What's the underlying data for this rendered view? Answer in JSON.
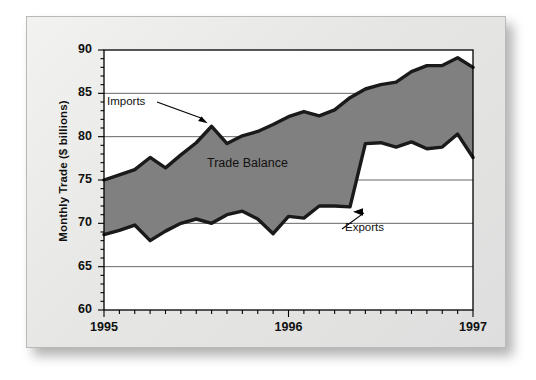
{
  "chart_data": {
    "type": "area",
    "title": "",
    "xlabel": "",
    "ylabel": "Monthly Trade ($ billions)",
    "ylim": [
      60,
      90
    ],
    "yticks": [
      60,
      65,
      70,
      75,
      80,
      85,
      90
    ],
    "ytick_labels": [
      "60",
      "65",
      "70",
      "75",
      "80",
      "85",
      "90"
    ],
    "xlim": [
      0,
      24
    ],
    "xticks": [
      0,
      12,
      24
    ],
    "xtick_labels": [
      "1995",
      "1996",
      "1997"
    ],
    "minor_xticks_per_interval": 12,
    "grid": "horizontal",
    "legend": "none",
    "annotations": [
      {
        "text": "Imports",
        "kind": "arrow-label",
        "points_to_series": "Imports"
      },
      {
        "text": "Exports",
        "kind": "arrow-label",
        "points_to_series": "Exports"
      },
      {
        "text": "Trade Balance",
        "kind": "region-label",
        "region": "between Imports and Exports"
      }
    ],
    "x": [
      0,
      1,
      2,
      3,
      4,
      5,
      6,
      7,
      8,
      9,
      10,
      11,
      12,
      13,
      14,
      15,
      16,
      17,
      18,
      19,
      20,
      21,
      22,
      23,
      24
    ],
    "series": [
      {
        "name": "Imports",
        "fill_to": "Exports",
        "color": "#1a1a1a",
        "values": [
          75.0,
          75.6,
          76.2,
          77.6,
          76.4,
          77.9,
          79.3,
          81.2,
          79.2,
          80.1,
          80.6,
          81.4,
          82.3,
          82.9,
          82.4,
          83.1,
          84.5,
          85.5,
          86.0,
          86.3,
          87.5,
          88.2,
          88.2,
          89.1,
          88.0
        ]
      },
      {
        "name": "Exports",
        "color": "#1a1a1a",
        "values": [
          68.7,
          69.2,
          69.8,
          68.0,
          69.1,
          70.0,
          70.5,
          70.0,
          71.0,
          71.4,
          70.5,
          68.8,
          70.8,
          70.6,
          72.0,
          72.0,
          71.9,
          79.2,
          79.3,
          78.8,
          79.4,
          78.6,
          78.8,
          80.3,
          77.6
        ]
      }
    ],
    "fill_region": {
      "name": "Trade Balance",
      "color": "#808080"
    }
  }
}
